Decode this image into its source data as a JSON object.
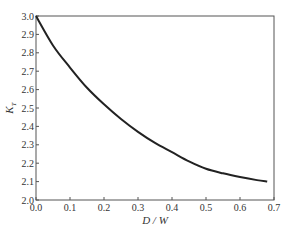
{
  "chart_data": {
    "type": "line",
    "title": "",
    "xlabel": "D / W",
    "ylabel": "K_T",
    "ylabel_main": "K",
    "ylabel_sub": "T",
    "xlim": [
      0.0,
      0.7
    ],
    "ylim": [
      2.0,
      3.0
    ],
    "xticks": [
      "0.0",
      "0.1",
      "0.2",
      "0.3",
      "0.4",
      "0.5",
      "0.6",
      "0.7"
    ],
    "yticks": [
      "2.0",
      "2.1",
      "2.2",
      "2.3",
      "2.4",
      "2.5",
      "2.6",
      "2.7",
      "2.8",
      "2.9",
      "3.0"
    ],
    "grid": false,
    "legend": null,
    "series": [
      {
        "name": "K_T",
        "color": "#222222",
        "x": [
          0.0,
          0.05,
          0.1,
          0.15,
          0.2,
          0.25,
          0.3,
          0.35,
          0.4,
          0.45,
          0.5,
          0.55,
          0.6,
          0.65,
          0.68
        ],
        "y": [
          3.0,
          2.84,
          2.72,
          2.61,
          2.52,
          2.44,
          2.37,
          2.31,
          2.26,
          2.21,
          2.17,
          2.145,
          2.125,
          2.108,
          2.1
        ]
      }
    ]
  }
}
